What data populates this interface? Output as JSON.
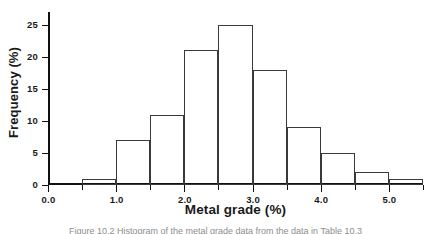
{
  "figure": {
    "caption": "Figure 10.2 Histogram of the metal grade data from the data in Table 10.3"
  },
  "chart_data": {
    "type": "bar",
    "title": "",
    "subtitle": "",
    "xlabel": "Metal grade (%)",
    "ylabel": "Frequency (%)",
    "xlim": [
      0.0,
      5.5
    ],
    "ylim": [
      0,
      27
    ],
    "grid": false,
    "legend": false,
    "legend_position": "none",
    "bin_width": 0.5,
    "bin_edges": [
      0.5,
      1.0,
      1.5,
      2.0,
      2.5,
      3.0,
      3.5,
      4.0,
      4.5,
      5.0,
      5.5
    ],
    "categories": [
      "0.5-1.0",
      "1.0-1.5",
      "1.5-2.0",
      "2.0-2.5",
      "2.5-3.0",
      "3.0-3.5",
      "3.5-4.0",
      "4.0-4.5",
      "4.5-5.0",
      "5.0-5.5"
    ],
    "values": [
      1,
      7,
      11,
      21,
      25,
      18,
      9,
      5,
      2,
      1
    ],
    "bar_style": "outline",
    "bar_edge_color": "#3a3a3a",
    "bar_fill_color": "#ffffff",
    "axis_color": "#111111",
    "xticks_major": [
      0.0,
      1.0,
      2.0,
      3.0,
      4.0,
      5.0
    ],
    "xticks_minor": [
      0.5,
      1.5,
      2.5,
      3.5,
      4.5,
      5.5
    ],
    "xtick_labels": [
      "0.0",
      "1.0",
      "2.0",
      "3.0",
      "4.0",
      "5.0"
    ],
    "yticks": [
      0,
      5,
      10,
      15,
      20,
      25
    ],
    "ytick_labels": [
      "0",
      "5",
      "10",
      "15",
      "20",
      "25"
    ]
  }
}
